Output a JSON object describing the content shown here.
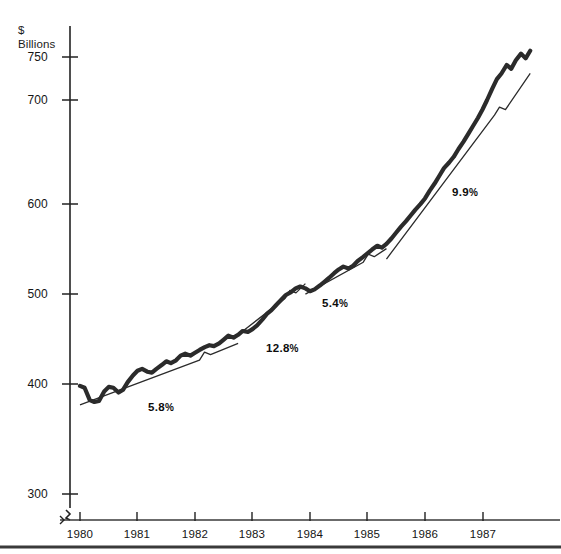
{
  "chart_data": {
    "type": "line",
    "title": "",
    "subtitle": "",
    "xlabel": "",
    "ylabel": "$\nBillions",
    "ylabel_lines": [
      "$",
      "Billions"
    ],
    "ylim": [
      300,
      775
    ],
    "xlim": [
      1980,
      1988
    ],
    "grid": false,
    "legend": false,
    "y_ticks": [
      300,
      400,
      500,
      600,
      700,
      750
    ],
    "y_tick_labels": [
      "300",
      "400",
      "500",
      "600",
      "700",
      "750"
    ],
    "x_ticks": [
      1980,
      1981,
      1982,
      1983,
      1984,
      1985,
      1986,
      1987
    ],
    "x_tick_labels": [
      "1980",
      "1981",
      "1982",
      "1983",
      "1984",
      "1985",
      "1986",
      "1987"
    ],
    "y_axis_break": true,
    "series": [
      {
        "name": "monthly-series",
        "style": "thick-solid",
        "x": [
          1980.0,
          1980.08,
          1980.17,
          1980.25,
          1980.33,
          1980.42,
          1980.5,
          1980.58,
          1980.67,
          1980.75,
          1980.83,
          1980.92,
          1981.0,
          1981.08,
          1981.17,
          1981.25,
          1981.33,
          1981.42,
          1981.5,
          1981.58,
          1981.67,
          1981.75,
          1981.83,
          1981.92,
          1982.0,
          1982.08,
          1982.17,
          1982.25,
          1982.33,
          1982.42,
          1982.5,
          1982.58,
          1982.67,
          1982.75,
          1982.83,
          1982.92,
          1983.0,
          1983.08,
          1983.17,
          1983.25,
          1983.33,
          1983.42,
          1983.5,
          1983.58,
          1983.67,
          1983.75,
          1983.83,
          1983.92,
          1984.0,
          1984.08,
          1984.17,
          1984.25,
          1984.33,
          1984.42,
          1984.5,
          1984.58,
          1984.67,
          1984.75,
          1984.83,
          1984.92,
          1985.0,
          1985.08,
          1985.17,
          1985.25,
          1985.33,
          1985.42,
          1985.5,
          1985.58,
          1985.67,
          1985.75,
          1985.83,
          1985.92,
          1986.0,
          1986.08,
          1986.17,
          1986.25,
          1986.33,
          1986.42,
          1986.5,
          1986.58,
          1986.67,
          1986.75,
          1986.83,
          1986.92,
          1987.0,
          1987.08,
          1987.17,
          1987.25,
          1987.33,
          1987.42,
          1987.5,
          1987.58,
          1987.67,
          1987.75,
          1987.83
        ],
        "values": [
          398,
          396,
          383,
          381,
          382,
          392,
          397,
          396,
          391,
          394,
          402,
          409,
          414,
          416,
          413,
          412,
          416,
          420,
          424,
          422,
          425,
          430,
          432,
          430,
          433,
          436,
          439,
          441,
          440,
          443,
          447,
          451,
          449,
          452,
          456,
          455,
          458,
          462,
          468,
          474,
          478,
          484,
          489,
          494,
          497,
          501,
          503,
          501,
          498,
          500,
          504,
          508,
          512,
          517,
          521,
          524,
          522,
          525,
          530,
          534,
          538,
          542,
          546,
          544,
          548,
          554,
          560,
          566,
          572,
          578,
          584,
          590,
          596,
          604,
          612,
          620,
          628,
          634,
          640,
          648,
          656,
          664,
          672,
          681,
          690,
          700,
          712,
          722,
          728,
          737,
          733,
          742,
          749,
          744,
          752
        ]
      }
    ],
    "trend_segments": [
      {
        "label": "5.8%",
        "annual_growth_pct": 5.8,
        "x_start": 1980.0,
        "x_end": 1982.75,
        "y_start": 378,
        "y_end": 443
      },
      {
        "label": "12.8%",
        "annual_growth_pct": 12.8,
        "x_start": 1982.75,
        "x_end": 1983.92,
        "y_start": 452,
        "y_end": 506
      },
      {
        "label": "5.4%",
        "annual_growth_pct": 5.4,
        "x_start": 1983.92,
        "x_end": 1985.33,
        "y_start": 495,
        "y_end": 543
      },
      {
        "label": "9.9%",
        "annual_growth_pct": 9.9,
        "x_start": 1985.33,
        "x_end": 1987.83,
        "y_start": 532,
        "y_end": 728
      }
    ],
    "annotations": [
      {
        "text": "5.8",
        "sign": "%",
        "x_px": 148,
        "y_px": 401
      },
      {
        "text": "12.8",
        "sign": "%",
        "x_px": 266,
        "y_px": 342
      },
      {
        "text": "5.4",
        "sign": "%",
        "x_px": 322,
        "y_px": 297
      },
      {
        "text": "9.9",
        "sign": "%",
        "x_px": 452,
        "y_px": 186
      }
    ]
  }
}
